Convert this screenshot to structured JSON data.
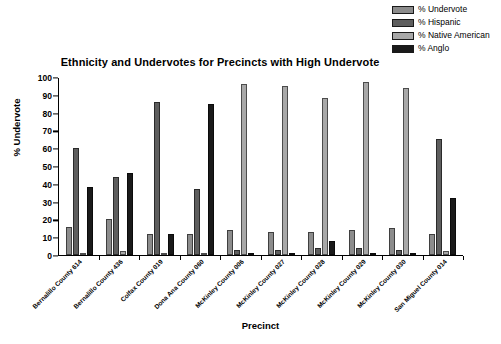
{
  "chart_data": {
    "type": "bar",
    "title": "Ethnicity and Undervotes for Precincts with  High Undervote",
    "xlabel": "Precinct",
    "ylabel": "% Undervote",
    "ylim": [
      0,
      100
    ],
    "yticks": [
      0,
      10,
      20,
      30,
      40,
      50,
      60,
      70,
      80,
      90,
      100
    ],
    "grid": false,
    "legend_position": "top-right",
    "categories": [
      "Bernalillo County 614",
      "Bernalillo County 436",
      "Colfax County 019",
      "Dona Ana County 060",
      "McKinley County 006",
      "McKinley County 027",
      "McKinley County 028",
      "McKinley County 029",
      "McKinley County 030",
      "San Miguel County 014"
    ],
    "series": [
      {
        "name": "% Undervote",
        "color": "#8c8c8c",
        "values": [
          16,
          20,
          12,
          12,
          14,
          13,
          13,
          14,
          15,
          12
        ]
      },
      {
        "name": "% Hispanic",
        "color": "#5e5e5e",
        "values": [
          60,
          44,
          86,
          37,
          3,
          3,
          4,
          4,
          3,
          65
        ]
      },
      {
        "name": "% Native American",
        "color": "#a8a8a8",
        "values": [
          1,
          2,
          1,
          1,
          96,
          95,
          88,
          97,
          94,
          2
        ]
      },
      {
        "name": "% Anglo",
        "color": "#1a1a1a",
        "values": [
          38,
          46,
          12,
          85,
          1,
          1,
          8,
          1,
          1,
          32
        ]
      }
    ]
  }
}
